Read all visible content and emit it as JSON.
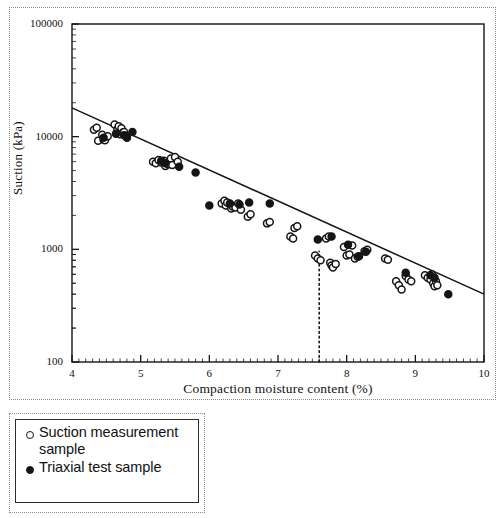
{
  "chart_data": {
    "type": "scatter",
    "title": "",
    "xlabel": "Compaction moisture content (%)",
    "ylabel": "Suction (kPa)",
    "xlim": [
      4,
      10
    ],
    "ylim": [
      100,
      100000
    ],
    "yscale": "log",
    "xscale": "linear",
    "grid": false,
    "legend_position": "below-plot-left",
    "xticks": [
      4,
      5,
      6,
      7,
      8,
      9,
      10
    ],
    "xtick_labels": [
      "4",
      "5",
      "6",
      "7",
      "8",
      "9",
      "10"
    ],
    "yticks": [
      100,
      1000,
      10000,
      100000
    ],
    "ytick_labels": [
      "100",
      "1000",
      "10000",
      "100000"
    ],
    "y_minor_ticks": true,
    "x_minor_ticks": true,
    "series": [
      {
        "name": "Suction measurement sample",
        "marker": "open-circle",
        "color": "#151515",
        "points": [
          [
            4.32,
            11500
          ],
          [
            4.36,
            12000
          ],
          [
            4.38,
            9200
          ],
          [
            4.44,
            10400
          ],
          [
            4.46,
            9400
          ],
          [
            4.48,
            9300
          ],
          [
            4.52,
            10100
          ],
          [
            4.62,
            12800
          ],
          [
            4.66,
            11600
          ],
          [
            4.68,
            12400
          ],
          [
            4.7,
            10500
          ],
          [
            4.72,
            11900
          ],
          [
            4.74,
            10900
          ],
          [
            4.76,
            11000
          ],
          [
            4.78,
            10200
          ],
          [
            5.18,
            6000
          ],
          [
            5.22,
            5800
          ],
          [
            5.26,
            6200
          ],
          [
            5.3,
            5900
          ],
          [
            5.34,
            6100
          ],
          [
            5.36,
            5500
          ],
          [
            5.4,
            5700
          ],
          [
            5.44,
            6400
          ],
          [
            5.46,
            5600
          ],
          [
            5.5,
            6600
          ],
          [
            5.54,
            6000
          ],
          [
            6.18,
            2550
          ],
          [
            6.22,
            2700
          ],
          [
            6.24,
            2450
          ],
          [
            6.26,
            2600
          ],
          [
            6.3,
            2500
          ],
          [
            6.32,
            2300
          ],
          [
            6.34,
            2400
          ],
          [
            6.38,
            2350
          ],
          [
            6.42,
            2550
          ],
          [
            6.46,
            2250
          ],
          [
            6.56,
            1950
          ],
          [
            6.6,
            2050
          ],
          [
            6.84,
            1700
          ],
          [
            6.88,
            1750
          ],
          [
            7.18,
            1300
          ],
          [
            7.22,
            1250
          ],
          [
            7.24,
            1550
          ],
          [
            7.28,
            1600
          ],
          [
            7.54,
            880
          ],
          [
            7.58,
            830
          ],
          [
            7.62,
            800
          ],
          [
            7.7,
            1250
          ],
          [
            7.74,
            1300
          ],
          [
            7.76,
            760
          ],
          [
            7.78,
            720
          ],
          [
            7.8,
            690
          ],
          [
            7.84,
            740
          ],
          [
            7.96,
            1050
          ],
          [
            8.0,
            880
          ],
          [
            8.04,
            900
          ],
          [
            8.08,
            1080
          ],
          [
            8.12,
            830
          ],
          [
            8.16,
            860
          ],
          [
            8.26,
            960
          ],
          [
            8.3,
            990
          ],
          [
            8.56,
            830
          ],
          [
            8.6,
            810
          ],
          [
            8.72,
            520
          ],
          [
            8.76,
            480
          ],
          [
            8.8,
            440
          ],
          [
            8.86,
            580
          ],
          [
            8.9,
            540
          ],
          [
            8.94,
            520
          ],
          [
            9.14,
            590
          ],
          [
            9.18,
            560
          ],
          [
            9.22,
            540
          ],
          [
            9.24,
            600
          ],
          [
            9.26,
            500
          ],
          [
            9.28,
            470
          ],
          [
            9.3,
            520
          ],
          [
            9.32,
            480
          ]
        ]
      },
      {
        "name": "Triaxial test sample",
        "marker": "filled-circle",
        "color": "#151515",
        "points": [
          [
            4.46,
            9800
          ],
          [
            4.64,
            10600
          ],
          [
            4.76,
            10300
          ],
          [
            4.8,
            9800
          ],
          [
            4.88,
            11000
          ],
          [
            5.3,
            6100
          ],
          [
            5.36,
            5800
          ],
          [
            5.56,
            5400
          ],
          [
            5.8,
            4800
          ],
          [
            6.0,
            2450
          ],
          [
            6.3,
            2550
          ],
          [
            6.44,
            2500
          ],
          [
            6.58,
            2600
          ],
          [
            6.88,
            2550
          ],
          [
            7.58,
            1220
          ],
          [
            7.78,
            1300
          ],
          [
            8.02,
            1100
          ],
          [
            8.18,
            870
          ],
          [
            8.28,
            950
          ],
          [
            8.86,
            620
          ],
          [
            9.22,
            590
          ],
          [
            9.28,
            560
          ],
          [
            9.48,
            400
          ]
        ]
      }
    ],
    "trend_line": {
      "name": "fitted regression line",
      "style": "solid",
      "color": "#151515",
      "x_start": 4.0,
      "y_start": 18000,
      "x_end": 10.0,
      "y_end": 400
    },
    "reference_line": {
      "name": "optimum moisture content marker",
      "style": "dotted",
      "orientation": "vertical",
      "color": "#151515",
      "x": 7.6,
      "y_from": 100,
      "y_to": 960
    }
  },
  "legend": {
    "entries": [
      {
        "marker": "open-circle",
        "label": "Suction measurement sample"
      },
      {
        "marker": "filled-circle",
        "label": "Triaxial test sample"
      }
    ]
  }
}
